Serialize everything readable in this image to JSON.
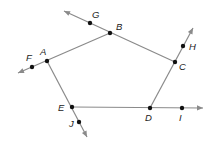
{
  "diagram": {
    "type": "pentagon-with-extended-sides",
    "line_color": "#8a8a8a",
    "point_color": "#111111",
    "vertices": [
      {
        "label": "A",
        "x": 47,
        "y": 61,
        "lx": 40,
        "ly": 55
      },
      {
        "label": "B",
        "x": 110,
        "y": 33,
        "lx": 116,
        "ly": 30
      },
      {
        "label": "C",
        "x": 175,
        "y": 62,
        "lx": 179,
        "ly": 70
      },
      {
        "label": "D",
        "x": 150,
        "y": 108,
        "lx": 145,
        "ly": 121
      },
      {
        "label": "E",
        "x": 72,
        "y": 107,
        "lx": 58,
        "ly": 111
      }
    ],
    "extension_points": [
      {
        "label": "F",
        "x": 32,
        "y": 67,
        "lx": 26,
        "ly": 61
      },
      {
        "label": "G",
        "x": 90,
        "y": 23,
        "lx": 92,
        "ly": 18
      },
      {
        "label": "H",
        "x": 183,
        "y": 46,
        "lx": 189,
        "ly": 50
      },
      {
        "label": "I",
        "x": 182,
        "y": 108,
        "lx": 179,
        "ly": 121
      },
      {
        "label": "J",
        "x": 79,
        "y": 122,
        "lx": 69,
        "ly": 127
      }
    ],
    "rays": [
      {
        "name": "ray-BA-through-F",
        "x1": 110,
        "y1": 33,
        "x2": 18,
        "y2": 73
      },
      {
        "name": "ray-CB-through-G",
        "x1": 175,
        "y1": 62,
        "x2": 64,
        "y2": 11
      },
      {
        "name": "ray-DC-through-H",
        "x1": 150,
        "y1": 108,
        "x2": 193,
        "y2": 28
      },
      {
        "name": "ray-ED-through-I",
        "x1": 72,
        "y1": 107,
        "x2": 203,
        "y2": 108
      },
      {
        "name": "ray-AE-through-J",
        "x1": 47,
        "y1": 61,
        "x2": 87,
        "y2": 137
      }
    ]
  }
}
